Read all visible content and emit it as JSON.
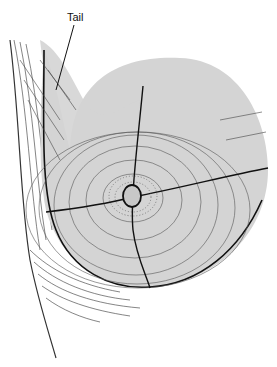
{
  "diagram": {
    "labels": [
      {
        "id": "tail",
        "text": "Tail",
        "x": 67,
        "y": 11
      }
    ],
    "colors": {
      "tissue_fill": "#d4d4d4",
      "line": "#111111",
      "background": "#ffffff"
    },
    "elements": [
      "breast-outline",
      "axillary-tail",
      "quadrant-lines",
      "areola",
      "nipple",
      "chest-wall-contour"
    ]
  }
}
